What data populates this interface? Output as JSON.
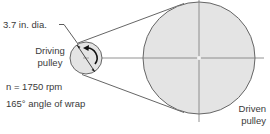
{
  "diagram": {
    "type": "belt-drive",
    "labels": {
      "diameter": "3.7 in. dia.",
      "driving_line1": "Driving",
      "driving_line2": "pulley",
      "speed": "n = 1750 rpm",
      "wrap": "165° angle of wrap",
      "driven_line1": "Driven",
      "driven_line2": "pulley"
    },
    "driving_pulley": {
      "diameter_in": 3.7,
      "speed_rpm": 1750,
      "wrap_angle_deg": 165,
      "rotation": "clockwise"
    },
    "colors": {
      "pulley_fill": "#e4e4e4",
      "line": "#555555",
      "background": "#ffffff"
    }
  }
}
